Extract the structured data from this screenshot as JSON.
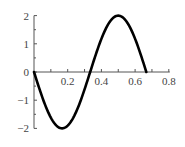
{
  "chart_data": {
    "type": "line",
    "title": "",
    "xlabel": "",
    "ylabel": "",
    "function": "y = -2 sin(3πx)",
    "xlim": [
      0,
      0.8
    ],
    "ylim": [
      -2,
      2
    ],
    "x_ticks": [
      0.2,
      0.4,
      0.6,
      0.8
    ],
    "x_tick_labels": [
      "0.2",
      "0.4",
      "0.6",
      "0.8"
    ],
    "x_minor_step": 0.1,
    "y_ticks": [
      2,
      1,
      0,
      -1,
      -2
    ],
    "y_tick_labels": [
      "2",
      "1",
      "0",
      "−1",
      "−2"
    ],
    "y_minor_step": 0.5,
    "grid": false,
    "legend": null,
    "series": [
      {
        "name": "curve",
        "color": "#000000",
        "x": [
          0,
          0.0833,
          0.1667,
          0.25,
          0.3333,
          0.4167,
          0.5,
          0.5833,
          0.6667
        ],
        "y": [
          0,
          -1.414,
          -2,
          -1.414,
          0,
          1.414,
          2,
          1.414,
          0
        ]
      }
    ]
  }
}
